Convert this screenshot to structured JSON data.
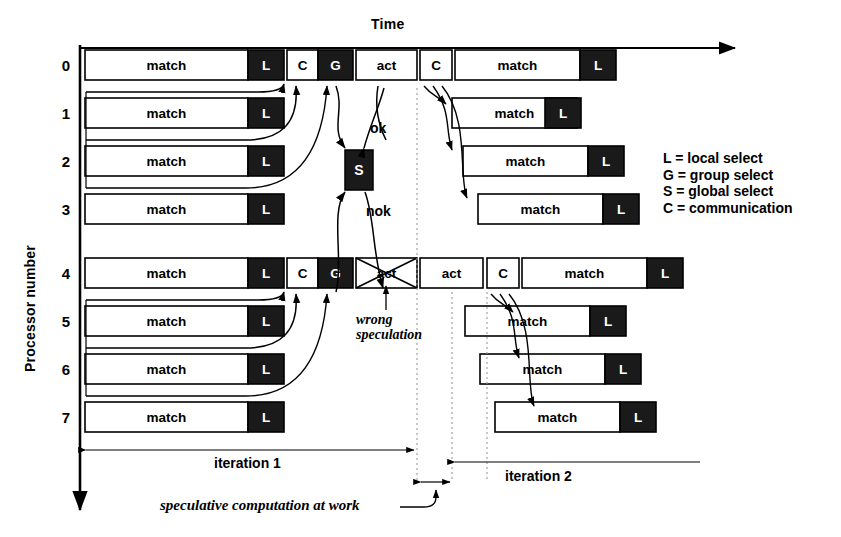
{
  "title_axis": {
    "time": "Time",
    "processor": "Processor number"
  },
  "axis_numbers": [
    "0",
    "1",
    "2",
    "3",
    "4",
    "5",
    "6",
    "7"
  ],
  "labels": {
    "match": "match",
    "act": "act",
    "L": "L",
    "C": "C",
    "G": "G",
    "S": "S",
    "ok": "ok",
    "nok": "nok"
  },
  "legend": [
    "L = local select",
    "G = group select",
    "S = global select",
    "C = communication"
  ],
  "annotations": {
    "wrong_speculation_line1": "wrong",
    "wrong_speculation_line2": "speculation",
    "iteration1": "iteration 1",
    "iteration2": "iteration 2",
    "speculative": "speculative computation at work"
  },
  "colors": {
    "fill_dark": "#1a1a1a",
    "fill_light": "#ffffff",
    "stroke": "#000000"
  },
  "chart_data": {
    "type": "gantt",
    "xlabel": "Time",
    "ylabel": "Processor number",
    "rows": [
      {
        "processor": "0",
        "y": 50,
        "blocks": [
          {
            "label": "match",
            "x": 85,
            "w": 163,
            "dark": false
          },
          {
            "label": "L",
            "x": 248,
            "w": 36,
            "dark": true
          },
          {
            "label": "C",
            "x": 287,
            "w": 31,
            "dark": false
          },
          {
            "label": "G",
            "x": 318,
            "w": 35,
            "dark": true
          },
          {
            "label": "act",
            "x": 356,
            "w": 61,
            "dark": false
          },
          {
            "label": "C",
            "x": 420,
            "w": 32,
            "dark": false
          },
          {
            "label": "match",
            "x": 455,
            "w": 125,
            "dark": false
          },
          {
            "label": "L",
            "x": 580,
            "w": 36,
            "dark": true
          }
        ]
      },
      {
        "processor": "1",
        "y": 98,
        "blocks": [
          {
            "label": "match",
            "x": 85,
            "w": 163,
            "dark": false
          },
          {
            "label": "L",
            "x": 248,
            "w": 36,
            "dark": true
          },
          {
            "label": "match",
            "x": 452,
            "w": 125,
            "dark": false
          },
          {
            "label": "L",
            "x": 545,
            "w": 36,
            "dark": true
          }
        ]
      },
      {
        "processor": "2",
        "y": 146,
        "blocks": [
          {
            "label": "match",
            "x": 85,
            "w": 163,
            "dark": false
          },
          {
            "label": "L",
            "x": 248,
            "w": 36,
            "dark": true
          },
          {
            "label": "match",
            "x": 463,
            "w": 125,
            "dark": false
          },
          {
            "label": "L",
            "x": 588,
            "w": 36,
            "dark": true
          }
        ]
      },
      {
        "processor": "3",
        "y": 194,
        "blocks": [
          {
            "label": "match",
            "x": 85,
            "w": 163,
            "dark": false
          },
          {
            "label": "L",
            "x": 248,
            "w": 36,
            "dark": true
          },
          {
            "label": "match",
            "x": 478,
            "w": 125,
            "dark": false
          },
          {
            "label": "L",
            "x": 603,
            "w": 36,
            "dark": true
          }
        ]
      },
      {
        "processor": "4",
        "y": 258,
        "blocks": [
          {
            "label": "match",
            "x": 85,
            "w": 163,
            "dark": false
          },
          {
            "label": "L",
            "x": 248,
            "w": 36,
            "dark": true
          },
          {
            "label": "C",
            "x": 287,
            "w": 31,
            "dark": false
          },
          {
            "label": "G",
            "x": 318,
            "w": 35,
            "dark": true
          },
          {
            "label": "act",
            "x": 356,
            "w": 61,
            "dark": false,
            "crossed": true
          },
          {
            "label": "act",
            "x": 420,
            "w": 63,
            "dark": false
          },
          {
            "label": "C",
            "x": 487,
            "w": 32,
            "dark": false
          },
          {
            "label": "match",
            "x": 522,
            "w": 125,
            "dark": false
          },
          {
            "label": "L",
            "x": 647,
            "w": 36,
            "dark": true
          }
        ]
      },
      {
        "processor": "5",
        "y": 306,
        "blocks": [
          {
            "label": "match",
            "x": 85,
            "w": 163,
            "dark": false
          },
          {
            "label": "L",
            "x": 248,
            "w": 36,
            "dark": true
          },
          {
            "label": "match",
            "x": 465,
            "w": 125,
            "dark": false
          },
          {
            "label": "L",
            "x": 590,
            "w": 36,
            "dark": true
          }
        ]
      },
      {
        "processor": "6",
        "y": 354,
        "blocks": [
          {
            "label": "match",
            "x": 85,
            "w": 163,
            "dark": false
          },
          {
            "label": "L",
            "x": 248,
            "w": 36,
            "dark": true
          },
          {
            "label": "match",
            "x": 480,
            "w": 125,
            "dark": false
          },
          {
            "label": "L",
            "x": 605,
            "w": 36,
            "dark": true
          }
        ]
      },
      {
        "processor": "7",
        "y": 402,
        "blocks": [
          {
            "label": "match",
            "x": 85,
            "w": 163,
            "dark": false
          },
          {
            "label": "L",
            "x": 248,
            "w": 36,
            "dark": true
          },
          {
            "label": "match",
            "x": 495,
            "w": 125,
            "dark": false
          },
          {
            "label": "L",
            "x": 620,
            "w": 36,
            "dark": true
          }
        ]
      }
    ],
    "global_select": {
      "label": "S",
      "x": 345,
      "y": 150,
      "w": 28,
      "h": 40
    },
    "iteration_spans": [
      {
        "label": "iteration 1",
        "x1": 85,
        "x2": 420
      },
      {
        "label": "iteration 2",
        "x1": 420,
        "x2": 700
      }
    ]
  }
}
